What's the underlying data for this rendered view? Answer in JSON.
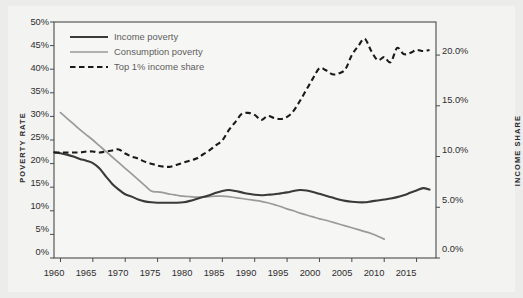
{
  "figure": {
    "background_color": "#ececeb",
    "paper_color": "#f3f3f1",
    "frame_color": "#4a4a4a"
  },
  "axes": {
    "left_title": "POVERTY RATE",
    "right_title": "INCOME SHARE",
    "left_ticks": [
      "0%",
      "5%",
      "10%",
      "15%",
      "20%",
      "25%",
      "30%",
      "35%",
      "40%",
      "45%",
      "50%"
    ],
    "right_ticks": [
      "0.0%",
      "5.0%",
      "10.0%",
      "15.0%",
      "20.0%"
    ],
    "x_ticks": [
      "1960",
      "1965",
      "1970",
      "1975",
      "1980",
      "1985",
      "1990",
      "1995",
      "2000",
      "2005",
      "2010",
      "2015"
    ]
  },
  "legend": {
    "items": [
      {
        "label": "Income poverty",
        "style": "solid",
        "color": "#3a3a3a"
      },
      {
        "label": "Consumption poverty",
        "style": "solid",
        "color": "#9a9a9a"
      },
      {
        "label": "Top 1% income share",
        "style": "dashed",
        "color": "#1a1a1a"
      }
    ]
  },
  "chart_data": {
    "type": "line",
    "title": "",
    "subtitle": "",
    "xlabel": "",
    "ylabel": "POVERTY RATE",
    "y2label": "INCOME SHARE",
    "xlim": [
      1959,
      2018
    ],
    "ylim": [
      0,
      50
    ],
    "y2lim": [
      0,
      23.26
    ],
    "grid": false,
    "legend_position": "top-left",
    "x_tick_values": [
      1960,
      1965,
      1970,
      1975,
      1980,
      1985,
      1990,
      1995,
      2000,
      2005,
      2010,
      2015
    ],
    "y_tick_values": [
      0,
      5,
      10,
      15,
      20,
      25,
      30,
      35,
      40,
      45,
      50
    ],
    "y2_tick_values": [
      0,
      5,
      10,
      15,
      20
    ],
    "series": [
      {
        "name": "Income poverty",
        "axis": "left",
        "unit": "%",
        "color": "#3a3a3a",
        "style": "solid",
        "x": [
          1959,
          1960,
          1961,
          1962,
          1963,
          1964,
          1965,
          1966,
          1967,
          1968,
          1969,
          1970,
          1971,
          1972,
          1973,
          1974,
          1975,
          1976,
          1977,
          1978,
          1979,
          1980,
          1981,
          1982,
          1983,
          1984,
          1985,
          1986,
          1987,
          1988,
          1989,
          1990,
          1991,
          1992,
          1993,
          1994,
          1995,
          1996,
          1997,
          1998,
          1999,
          2000,
          2001,
          2002,
          2003,
          2004,
          2005,
          2006,
          2007,
          2008,
          2009,
          2010,
          2011,
          2012,
          2013,
          2014,
          2015,
          2016,
          2017
        ],
        "y": [
          22.4,
          22.2,
          21.9,
          21.5,
          21.0,
          20.6,
          20.1,
          19.0,
          17.3,
          15.7,
          14.5,
          13.5,
          13.0,
          12.4,
          12.0,
          11.8,
          11.7,
          11.7,
          11.7,
          11.7,
          11.8,
          12.1,
          12.5,
          12.9,
          13.3,
          13.8,
          14.2,
          14.4,
          14.2,
          13.9,
          13.6,
          13.4,
          13.3,
          13.4,
          13.5,
          13.7,
          13.9,
          14.2,
          14.4,
          14.3,
          14.0,
          13.6,
          13.2,
          12.8,
          12.4,
          12.1,
          11.9,
          11.8,
          11.8,
          12.0,
          12.2,
          12.4,
          12.6,
          12.9,
          13.3,
          13.8,
          14.3,
          14.8,
          14.5
        ],
        "note": "Left axis; ends near 13.6% at 2017"
      },
      {
        "name": "Consumption poverty",
        "axis": "left",
        "unit": "%",
        "color": "#9a9a9a",
        "style": "solid",
        "x": [
          1960,
          1961,
          1962,
          1963,
          1964,
          1965,
          1966,
          1967,
          1968,
          1969,
          1970,
          1971,
          1972,
          1973,
          1974,
          1975,
          1976,
          1977,
          1978,
          1979,
          1980,
          1981,
          1982,
          1983,
          1984,
          1985,
          1986,
          1987,
          1988,
          1989,
          1990,
          1991,
          1992,
          1993,
          1994,
          1995,
          1996,
          1997,
          1998,
          1999,
          2000,
          2001,
          2002,
          2003,
          2004,
          2005,
          2006,
          2007,
          2008,
          2009,
          2010
        ],
        "y": [
          30.8,
          29.6,
          28.4,
          27.2,
          26.1,
          25.0,
          23.8,
          22.6,
          21.4,
          20.2,
          19.0,
          17.8,
          16.6,
          15.4,
          14.2,
          14.0,
          13.8,
          13.5,
          13.3,
          13.1,
          13.0,
          12.9,
          12.9,
          13.0,
          13.1,
          13.1,
          13.0,
          12.8,
          12.6,
          12.4,
          12.2,
          12.0,
          11.7,
          11.3,
          10.9,
          10.4,
          10.0,
          9.5,
          9.1,
          8.7,
          8.3,
          8.0,
          7.6,
          7.2,
          6.8,
          6.4,
          6.0,
          5.6,
          5.2,
          4.6,
          4.0
        ],
        "note": "Left axis; starts 30.8% in 1960, kink at 1973, ends 4.0% in 2010"
      },
      {
        "name": "Top 1% income share",
        "axis": "right",
        "unit": "%",
        "color": "#1a1a1a",
        "style": "dashed",
        "x": [
          1959,
          1960,
          1961,
          1962,
          1963,
          1964,
          1965,
          1966,
          1967,
          1968,
          1969,
          1970,
          1971,
          1972,
          1973,
          1974,
          1975,
          1976,
          1977,
          1978,
          1979,
          1980,
          1981,
          1982,
          1983,
          1984,
          1985,
          1986,
          1987,
          1988,
          1989,
          1990,
          1991,
          1992,
          1993,
          1994,
          1995,
          1996,
          1997,
          1998,
          1999,
          2000,
          2001,
          2002,
          2003,
          2004,
          2005,
          2006,
          2007,
          2008,
          2009,
          2010,
          2011,
          2012,
          2013,
          2014,
          2015,
          2016,
          2017
        ],
        "y": [
          10.4,
          10.4,
          10.4,
          10.4,
          10.4,
          10.5,
          10.5,
          10.4,
          10.5,
          10.6,
          10.7,
          10.3,
          10.0,
          9.8,
          9.5,
          9.3,
          9.1,
          9.0,
          9.0,
          9.2,
          9.4,
          9.6,
          9.8,
          10.2,
          10.6,
          11.1,
          11.6,
          12.6,
          13.4,
          14.2,
          14.3,
          14.1,
          13.6,
          14.0,
          13.8,
          13.7,
          13.9,
          14.5,
          15.5,
          16.6,
          17.7,
          18.7,
          18.5,
          18.1,
          18.2,
          18.6,
          20.0,
          20.9,
          21.6,
          20.4,
          19.5,
          19.8,
          19.3,
          20.7,
          20.1,
          20.2,
          20.5,
          20.4,
          20.5
        ],
        "note": "Right axis; peak ~21.6% in 2007, ends ~20.5%"
      }
    ]
  }
}
